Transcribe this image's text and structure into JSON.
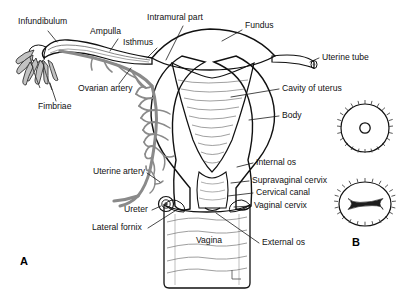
{
  "figure": {
    "panels": [
      {
        "id": "A",
        "label": "A",
        "x": 20,
        "y": 262,
        "description": "Coronal section of uterus, uterine tubes and vagina"
      },
      {
        "id": "B",
        "label": "B",
        "x": 352,
        "y": 243,
        "description": "External os appearances"
      }
    ],
    "background_color": "#ffffff",
    "ink_color": "#111111"
  },
  "colors": {
    "organ_fill_light": "#e2e2e2",
    "organ_fill_mid": "#c9c9c9",
    "organ_fill_dark": "#b0b0b0",
    "cavity_fill": "#bdbdbd",
    "vessel_gray": "#8a8a8a",
    "outline": "#111111",
    "inset_fill": "#d8d8d8",
    "text": "#111111"
  },
  "labels": [
    {
      "name": "infundibulum",
      "text": "Infundibulum",
      "x": 18,
      "y": 22,
      "anchor": "start"
    },
    {
      "name": "ampulla",
      "text": "Ampulla",
      "x": 90,
      "y": 32,
      "anchor": "start"
    },
    {
      "name": "isthmus",
      "text": "Isthmus",
      "x": 123,
      "y": 43,
      "anchor": "start"
    },
    {
      "name": "intramural-part",
      "text": "Intramural part",
      "x": 147,
      "y": 18,
      "anchor": "start"
    },
    {
      "name": "fundus",
      "text": "Fundus",
      "x": 245,
      "y": 26,
      "anchor": "start"
    },
    {
      "name": "uterine-tube",
      "text": "Uterine tube",
      "x": 322,
      "y": 58,
      "anchor": "start"
    },
    {
      "name": "cavity-of-uterus",
      "text": "Cavity of uterus",
      "x": 282,
      "y": 89,
      "anchor": "start"
    },
    {
      "name": "body",
      "text": "Body",
      "x": 282,
      "y": 116,
      "anchor": "start"
    },
    {
      "name": "ovarian-artery",
      "text": "Ovarian artery",
      "x": 78,
      "y": 89,
      "anchor": "start"
    },
    {
      "name": "fimbriae",
      "text": "Fimbriae",
      "x": 38,
      "y": 107,
      "anchor": "start"
    },
    {
      "name": "internal-os",
      "text": "Internal os",
      "x": 256,
      "y": 163,
      "anchor": "start"
    },
    {
      "name": "supravaginal-cervix",
      "text": "Supravaginal cervix",
      "x": 252,
      "y": 181,
      "anchor": "start"
    },
    {
      "name": "cervical-canal",
      "text": "Cervical canal",
      "x": 256,
      "y": 193,
      "anchor": "start"
    },
    {
      "name": "vaginal-cervix",
      "text": "Vaginal cervix",
      "x": 254,
      "y": 206,
      "anchor": "start"
    },
    {
      "name": "external-os",
      "text": "External os",
      "x": 262,
      "y": 243,
      "anchor": "start"
    },
    {
      "name": "uterine-artery",
      "text": "Uterine artery",
      "x": 93,
      "y": 172,
      "anchor": "start"
    },
    {
      "name": "ureter",
      "text": "Ureter",
      "x": 124,
      "y": 210,
      "anchor": "start"
    },
    {
      "name": "lateral-fornix",
      "text": "Lateral fornix",
      "x": 92,
      "y": 228,
      "anchor": "start"
    },
    {
      "name": "vagina",
      "text": "Vagina",
      "x": 196,
      "y": 241,
      "anchor": "start"
    }
  ],
  "insets": [
    {
      "name": "nulliparous-os",
      "cx": 365,
      "cy": 128,
      "rx": 24,
      "ry": 24,
      "os_shape": "round"
    },
    {
      "name": "parous-os",
      "cx": 365,
      "cy": 204,
      "rx": 26,
      "ry": 22,
      "os_shape": "slit"
    }
  ]
}
